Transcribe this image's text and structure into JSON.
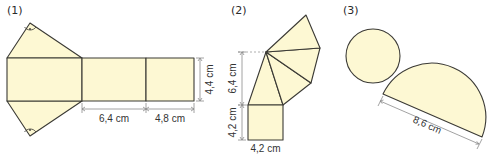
{
  "figures": [
    {
      "number": "(1)",
      "description": "Net of a triangular prism",
      "dimensions": {
        "length_1": "6,4 cm",
        "length_2": "4,8 cm",
        "height": "4,4 cm"
      },
      "right_angle_marks": 2
    },
    {
      "number": "(2)",
      "description": "Net of a square pyramid",
      "dimensions": {
        "triangle_height": "6,4 cm",
        "square_side_vertical": "4,2 cm",
        "square_side_horizontal": "4,2 cm"
      }
    },
    {
      "number": "(3)",
      "description": "Net of a cone (circle and semicircle)",
      "dimensions": {
        "diameter": "8,6 cm"
      }
    }
  ],
  "colors": {
    "fill": "#fdf8d3",
    "stroke": "#3b3a35",
    "dimension_line": "#8a8a8a"
  }
}
